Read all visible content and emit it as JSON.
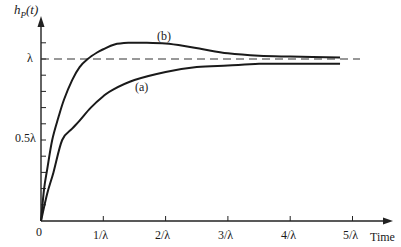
{
  "chart_data": {
    "type": "line",
    "title": "",
    "ylabel": "h_P(t)",
    "xlabel": "Time",
    "x_tick_labels": [
      "0",
      "1/λ",
      "2/λ",
      "3/λ",
      "4/λ",
      "5/λ"
    ],
    "x_ticks": [
      0,
      1,
      2,
      3,
      4,
      5
    ],
    "y_tick_labels": [
      "0.5λ",
      "λ"
    ],
    "y_ticks": [
      0.5,
      1.0
    ],
    "y_minor_tick_step": 0.1,
    "xlim": [
      0,
      5.5
    ],
    "ylim": [
      0,
      1.2
    ],
    "grid": false,
    "reference_line": {
      "y": 1.0,
      "style": "dashed",
      "label": "λ"
    },
    "series": [
      {
        "name": "(a)",
        "x": [
          0,
          0.1,
          0.2,
          0.34,
          0.5,
          0.62,
          0.8,
          1.0,
          1.15,
          1.5,
          2.0,
          2.5,
          3.0,
          3.5,
          4.0,
          4.8
        ],
        "values": [
          0,
          0.17,
          0.3,
          0.5,
          0.57,
          0.62,
          0.7,
          0.77,
          0.81,
          0.87,
          0.92,
          0.95,
          0.96,
          0.97,
          0.97,
          0.97
        ]
      },
      {
        "name": "(b)",
        "x": [
          0,
          0.05,
          0.1,
          0.18,
          0.28,
          0.37,
          0.5,
          0.62,
          0.75,
          0.9,
          1.0,
          1.18,
          1.4,
          1.7,
          2.0,
          2.3,
          2.6,
          3.0,
          3.5,
          4.0,
          4.8
        ],
        "values": [
          0,
          0.2,
          0.32,
          0.5,
          0.64,
          0.75,
          0.87,
          0.95,
          1.0,
          1.04,
          1.06,
          1.09,
          1.1,
          1.1,
          1.095,
          1.08,
          1.06,
          1.035,
          1.02,
          1.015,
          1.01
        ]
      }
    ],
    "annotations": [
      {
        "text": "(a)",
        "x": 1.64,
        "y": 0.82
      },
      {
        "text": "(b)",
        "x": 1.98,
        "y": 1.13
      }
    ]
  },
  "labels": {
    "y_axis": "h",
    "y_axis_sub": "P",
    "y_axis_arg": "(t)",
    "x_axis": "Time",
    "lambda": "λ",
    "half_lambda": "0.5λ",
    "origin": "0",
    "curve_a": "(a)",
    "curve_b": "(b)",
    "x_ticks": [
      "1/λ",
      "2/λ",
      "3/λ",
      "4/λ",
      "5/λ"
    ]
  }
}
